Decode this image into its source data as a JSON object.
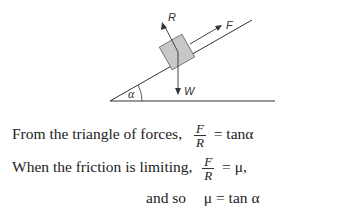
{
  "diagram": {
    "labels": {
      "reaction": "R",
      "friction": "F",
      "weight": "W",
      "angle": "α"
    },
    "colors": {
      "line": "#333333",
      "block_fill": "#c8c8c8",
      "block_stroke": "#666666"
    }
  },
  "equations": [
    {
      "prefix": "From the triangle of forces,",
      "numerator": "F",
      "denominator": "R",
      "rhs": "= tanα"
    },
    {
      "prefix": "When the friction is limiting,",
      "numerator": "F",
      "denominator": "R",
      "rhs": "= μ,"
    },
    {
      "prefix": "and so",
      "result": "μ = tan α"
    }
  ]
}
